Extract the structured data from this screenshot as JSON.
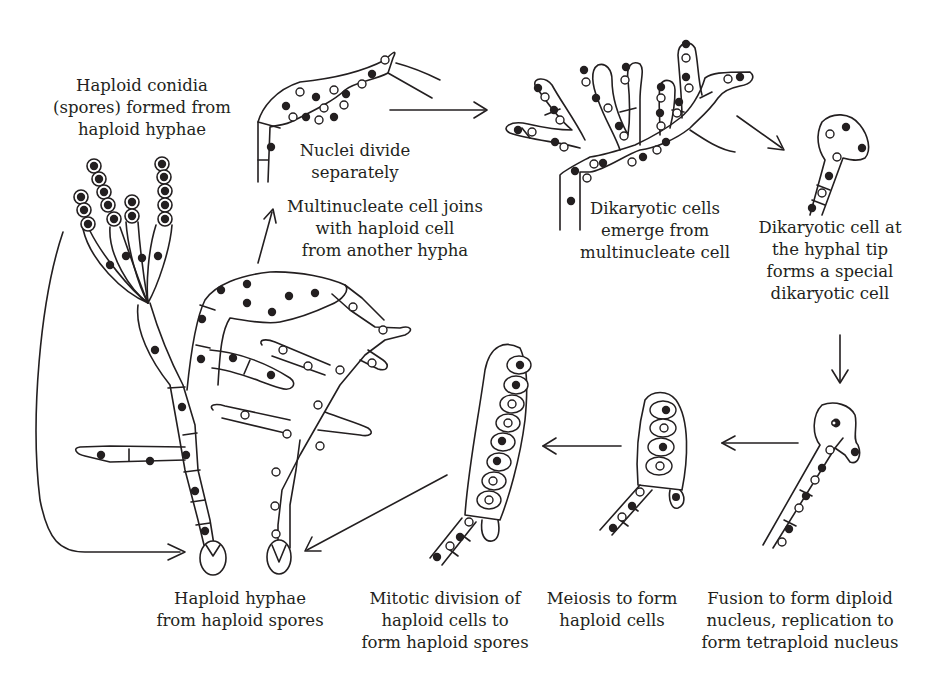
{
  "diagram": {
    "labels": {
      "conidia": [
        "Haploid conidia",
        "(spores) formed from",
        "haploid hyphae"
      ],
      "nuclei_divide": [
        "Nuclei divide",
        "separately"
      ],
      "multinucleate_join": [
        "Multinucleate cell joins",
        "with haploid cell",
        "from another hypha"
      ],
      "dikaryotic_emerge": [
        "Dikaryotic cells",
        "emerge from",
        "multinucleate cell"
      ],
      "dikaryotic_tip": [
        "Dikaryotic cell at",
        "the hyphal tip",
        "forms a special",
        "dikaryotic cell"
      ],
      "fusion": [
        "Fusion to form diploid",
        "nucleus, replication to",
        "form tetraploid nucleus"
      ],
      "meiosis": [
        "Meiosis to form",
        "haploid cells"
      ],
      "mitotic": [
        "Mitotic division of",
        "haploid cells to",
        "form haploid spores"
      ],
      "haploid_hyphae": [
        "Haploid hyphae",
        "from haploid spores"
      ]
    },
    "stages": [
      {
        "id": "conidia",
        "name": "Haploid conidia formation"
      },
      {
        "id": "multinucleate_join",
        "name": "Multinucleate cell joins haploid cell"
      },
      {
        "id": "nuclei_divide",
        "name": "Nuclei divide separately"
      },
      {
        "id": "dikaryotic_emerge",
        "name": "Dikaryotic cells emerge"
      },
      {
        "id": "dikaryotic_tip",
        "name": "Special dikaryotic tip cell"
      },
      {
        "id": "fusion",
        "name": "Nuclear fusion and replication"
      },
      {
        "id": "meiosis",
        "name": "Meiosis"
      },
      {
        "id": "mitotic",
        "name": "Mitotic division to spores"
      },
      {
        "id": "haploid_hyphae",
        "name": "Haploid hyphae from spores"
      }
    ],
    "legend_implied": {
      "filled_nucleus": "nucleus type A (black)",
      "open_nucleus": "nucleus type B (white)"
    },
    "colors": {
      "ink": "#231f20",
      "background": "#ffffff"
    }
  }
}
